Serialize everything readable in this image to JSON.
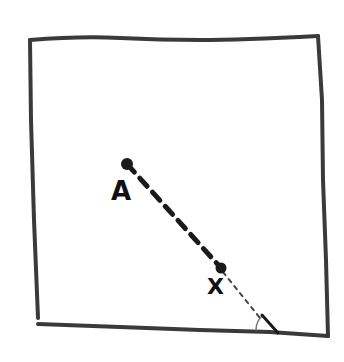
{
  "diagram": {
    "type": "hand-drawn geometry sketch",
    "colors": {
      "ink": "#1a1a1a",
      "box_stroke": "#3a3a3a",
      "background": "#ffffff"
    },
    "box": {
      "description": "square enclosure",
      "top_left": [
        30,
        38
      ],
      "top_right": [
        318,
        36
      ],
      "bottom_right": [
        328,
        336
      ],
      "bottom_left": [
        38,
        324
      ]
    },
    "points": [
      {
        "id": "A",
        "label": "A",
        "position": [
          127,
          164
        ]
      },
      {
        "id": "X",
        "label": "X",
        "position": [
          221,
          268
        ]
      }
    ],
    "segments": [
      {
        "from": "A",
        "to": "X",
        "style": "bold-dashed"
      },
      {
        "from": "X",
        "to": "bottom-edge",
        "style": "light-dotted",
        "end": [
          262,
          320
        ]
      }
    ],
    "angle_mark": {
      "description": "small angle marker where dotted line meets bottom edge",
      "vertex": [
        262,
        318
      ]
    }
  }
}
